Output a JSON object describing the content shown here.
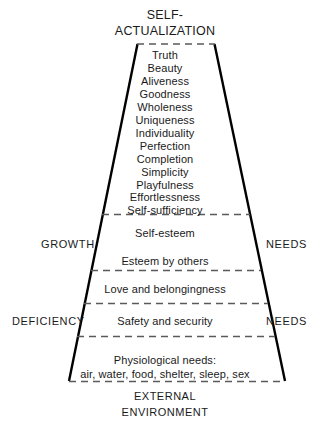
{
  "figure": {
    "type": "maslow-hierarchy-of-needs-trapezoid",
    "title": {
      "line1": "SELF-",
      "line2": "ACTUALIZATION"
    },
    "being_values": [
      "Truth",
      "Beauty",
      "Aliveness",
      "Goodness",
      "Wholeness",
      "Uniqueness",
      "Individuality",
      "Perfection",
      "Completion",
      "Simplicity",
      "Playfulness",
      "Effortlessness",
      "Self-sufficiency"
    ],
    "tiers": [
      {
        "label": "Self-esteem"
      },
      {
        "label": "Esteem by others"
      },
      {
        "label": "Love and belongingness"
      },
      {
        "label": "Safety and security"
      },
      {
        "label": "Physiological needs:"
      },
      {
        "label": "air, water, food, shelter, sleep, sex"
      }
    ],
    "side_labels": {
      "growth_left": "GROWTH",
      "growth_right": "NEEDS",
      "deficiency_left": "DEFICIENCY",
      "deficiency_right": "NEEDS"
    },
    "caption": {
      "line1": "EXTERNAL",
      "line2": "ENVIRONMENT"
    },
    "colors": {
      "outline": "#000000",
      "divider": "#5a5a5a",
      "text": "#1a1a1a",
      "background": "#ffffff"
    }
  }
}
